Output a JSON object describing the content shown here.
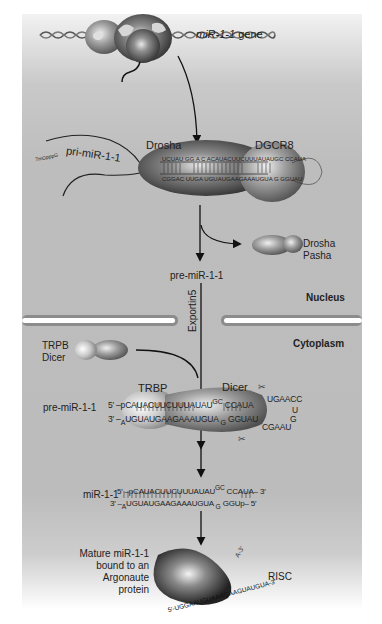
{
  "figure": {
    "labels": {
      "gene": "miR-1-1 gene",
      "gene_italic": "miR-1-1",
      "gene_suffix": " gene",
      "pri_mirna": "pri-miR-1-1",
      "pri_cap": "7mGpppG",
      "drosha": "Drosha",
      "dgcr8": "DGCR8",
      "released_1": "Drosha",
      "released_2": "Pasha",
      "pre_mirna": "pre-miR-1-1",
      "nucleus": "Nucleus",
      "exportin": "Exportin5",
      "cytoplasm": "Cytoplasm",
      "trpb": "TRPB",
      "dicer_free": "Dicer",
      "trbp": "TRBP",
      "dicer": "Dicer",
      "pre_mirna_cyto": "pre-miR-1-1",
      "mirna_duplex": "miR-1-1",
      "mature_1": "Mature miR-1-1",
      "mature_2": "bound to an",
      "mature_3": "Argonaute",
      "mature_4": "protein",
      "risc": "RISC"
    },
    "sequences": {
      "drosha_top": "UCUAU GG A C ACAUACUUCUUUAUAUGC CCAUA",
      "drosha_bottom": "CGGAC UUGA UGUAUGAAGAAAUGUA G GGUAU",
      "pre_top_prefix": "5′ –p",
      "pre_top": "CAUACUUCUUUAUAU",
      "pre_top_bulge": "GC",
      "pre_top_end": "CCAUA",
      "pre_loop_top": "UGAACC",
      "pre_loop_right": "U",
      "pre_loop_g": "G",
      "pre_loop_bottom": "CGAAU",
      "pre_bottom_prefix": "3′ –",
      "pre_bottom_a": "A",
      "pre_bottom": "UGUAUGAAGAAAUGUA",
      "pre_bottom_g": "G",
      "pre_bottom_end": "GGUAU",
      "duplex_top_prefix": "5′ –p",
      "duplex_top": "CAUACUUCUUUAUAU",
      "duplex_top_bulge": "GC",
      "duplex_top_end": "CCAUA– 3′",
      "duplex_bottom_prefix": "3′ –",
      "duplex_bottom_a": "A",
      "duplex_bottom": "UGUAUGAAGAAAUGUA",
      "duplex_bottom_g": "G",
      "duplex_bottom_end": "GGUp– 5′",
      "risc_strand": "5′-UGGAAUGUAAAGAAGUAUGUA-3′",
      "risc_tail": "UAUG",
      "risc_3prime": "A-3′"
    },
    "colors": {
      "panel_bg": "#bdbdbd",
      "membrane": "#8a8a8a",
      "protein_dark": "#3c3c3c",
      "protein_light": "#d8d8d8",
      "text": "#222222"
    }
  }
}
